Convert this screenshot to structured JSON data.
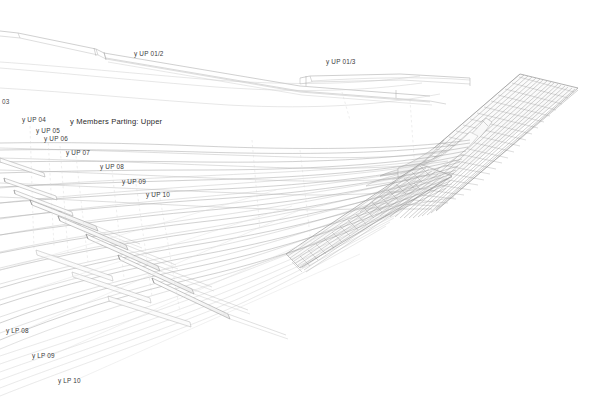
{
  "drawing": {
    "title": "y Members Parting: Upper",
    "type": "axonometric-line-drawing",
    "background_color": "#ffffff",
    "line_color": "#9a9a9a",
    "line_color_dark": "#6d6d6d",
    "line_color_faint": "#d8d8d8",
    "text_color": "#3a3a3a"
  },
  "labels": [
    {
      "id": "up-01-2",
      "text": "y UP 01/2",
      "x": 134,
      "y": 51
    },
    {
      "id": "up-01-3",
      "text": "y UP 01/3",
      "x": 326,
      "y": 59
    },
    {
      "id": "up-03",
      "text": "03",
      "x": 2,
      "y": 99
    },
    {
      "id": "up-04",
      "text": "y UP 04",
      "x": 22,
      "y": 117
    },
    {
      "id": "up-05",
      "text": "y UP 05",
      "x": 36,
      "y": 128
    },
    {
      "id": "up-06",
      "text": "y UP 06",
      "x": 44,
      "y": 136
    },
    {
      "id": "up-07",
      "text": "y UP 07",
      "x": 66,
      "y": 150
    },
    {
      "id": "up-08",
      "text": "y UP 08",
      "x": 100,
      "y": 164
    },
    {
      "id": "up-09",
      "text": "y UP 09",
      "x": 122,
      "y": 179
    },
    {
      "id": "up-10",
      "text": "y UP 10",
      "x": 146,
      "y": 192
    },
    {
      "id": "lp-08",
      "text": "y LP 08",
      "x": 6,
      "y": 328
    },
    {
      "id": "lp-09",
      "text": "y LP 09",
      "x": 32,
      "y": 353
    },
    {
      "id": "lp-10",
      "text": "y LP 10",
      "x": 58,
      "y": 378
    }
  ],
  "title_label": {
    "text": "y Members Parting: Upper",
    "x": 70,
    "y": 118
  },
  "geometry": {
    "ruled_surface_line_count": 34,
    "member_count_upper": 10,
    "member_count_lower": 3,
    "fan_strand_count": 44
  }
}
